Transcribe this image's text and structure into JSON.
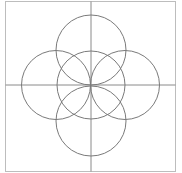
{
  "canvas": {
    "width": 182,
    "height": 173,
    "background": "#ffffff"
  },
  "frame": {
    "x": 5.5,
    "y": 1.5,
    "width": 170,
    "height": 170,
    "stroke": "#bdbdbd",
    "stroke_width": 1
  },
  "axes": {
    "stroke": "#8a8a8a",
    "stroke_width": 1,
    "vertical": {
      "x": 91,
      "y1": 1.5,
      "y2": 171.5
    },
    "horizontal": {
      "y": 85,
      "x1": 5.5,
      "x2": 175.5
    }
  },
  "circles": [
    {
      "name": "center",
      "cx": 91,
      "cy": 85,
      "r": 34
    },
    {
      "name": "top",
      "cx": 91,
      "cy": 50,
      "r": 35
    },
    {
      "name": "bottom",
      "cx": 91,
      "cy": 121,
      "r": 35
    },
    {
      "name": "left",
      "cx": 56,
      "cy": 85,
      "r": 34.5
    },
    {
      "name": "right",
      "cx": 125,
      "cy": 85,
      "r": 34.5
    }
  ],
  "circle_style": {
    "stroke": "#7a7a7a",
    "stroke_width": 1,
    "fill": "none"
  }
}
